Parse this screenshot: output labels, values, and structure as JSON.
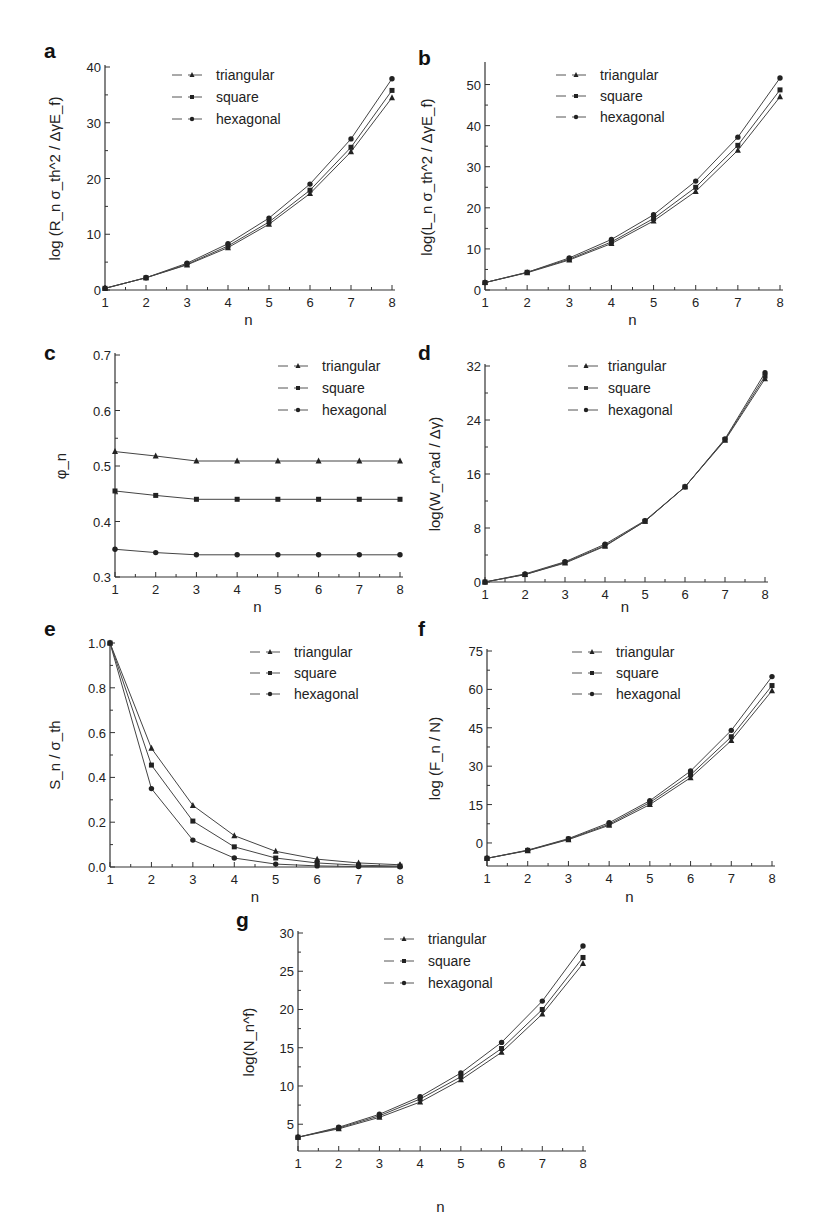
{
  "figure": {
    "legend_labels": [
      "triangular",
      "square",
      "hexagonal"
    ],
    "marker_shapes": [
      "triangle",
      "square",
      "circle"
    ],
    "line_color": "#444444",
    "marker_color": "#222222"
  },
  "chart_data": [
    {
      "panel": "a",
      "type": "line",
      "xlabel": "n",
      "ylabel": "log (R_n σ_th^2 / ΔγE_f)",
      "x": [
        1,
        2,
        3,
        4,
        5,
        6,
        7,
        8
      ],
      "xlim": [
        1,
        8
      ],
      "ylim": [
        0,
        40
      ],
      "yticks": [
        0,
        10,
        20,
        30,
        40
      ],
      "xticks": [
        1,
        2,
        3,
        4,
        5,
        6,
        7,
        8
      ],
      "series": [
        {
          "name": "triangular",
          "values": [
            0.3,
            2.2,
            4.5,
            7.6,
            11.8,
            17.3,
            24.8,
            34.5
          ]
        },
        {
          "name": "square",
          "values": [
            0.3,
            2.2,
            4.6,
            7.9,
            12.2,
            17.9,
            25.6,
            35.8
          ]
        },
        {
          "name": "hexagonal",
          "values": [
            0.3,
            2.2,
            4.8,
            8.3,
            12.9,
            19.0,
            27.1,
            37.9
          ]
        }
      ],
      "legend_position": "upper-center"
    },
    {
      "panel": "b",
      "type": "line",
      "xlabel": "n",
      "ylabel": "log(L_n σ_th^2 / ΔγE_f)",
      "x": [
        1,
        2,
        3,
        4,
        5,
        6,
        7,
        8
      ],
      "xlim": [
        1,
        8
      ],
      "ylim": [
        0,
        55
      ],
      "yticks": [
        0,
        10,
        20,
        30,
        40,
        50
      ],
      "xticks": [
        1,
        2,
        3,
        4,
        5,
        6,
        7,
        8
      ],
      "series": [
        {
          "name": "triangular",
          "values": [
            1.8,
            4.2,
            7.3,
            11.3,
            16.8,
            24.0,
            34.0,
            47.0
          ]
        },
        {
          "name": "square",
          "values": [
            1.8,
            4.3,
            7.5,
            11.7,
            17.4,
            25.0,
            35.2,
            48.7
          ]
        },
        {
          "name": "hexagonal",
          "values": [
            1.8,
            4.3,
            7.8,
            12.3,
            18.3,
            26.5,
            37.2,
            51.6
          ]
        }
      ],
      "legend_position": "upper-center"
    },
    {
      "panel": "c",
      "type": "line",
      "xlabel": "n",
      "ylabel": "φ_n",
      "x": [
        1,
        2,
        3,
        4,
        5,
        6,
        7,
        8
      ],
      "xlim": [
        1,
        8
      ],
      "ylim": [
        0.3,
        0.7
      ],
      "yticks": [
        0.3,
        0.4,
        0.5,
        0.6,
        0.7
      ],
      "xticks": [
        1,
        2,
        3,
        4,
        5,
        6,
        7,
        8
      ],
      "series": [
        {
          "name": "triangular",
          "values": [
            0.526,
            0.518,
            0.509,
            0.509,
            0.509,
            0.509,
            0.509,
            0.509
          ]
        },
        {
          "name": "square",
          "values": [
            0.455,
            0.447,
            0.44,
            0.44,
            0.44,
            0.44,
            0.44,
            0.44
          ]
        },
        {
          "name": "hexagonal",
          "values": [
            0.35,
            0.344,
            0.34,
            0.34,
            0.34,
            0.34,
            0.34,
            0.34
          ]
        }
      ],
      "legend_position": "upper-right"
    },
    {
      "panel": "d",
      "type": "line",
      "xlabel": "n",
      "ylabel": "log(W_n^ad / Δγ)",
      "x": [
        1,
        2,
        3,
        4,
        5,
        6,
        7,
        8
      ],
      "xlim": [
        1,
        8
      ],
      "ylim": [
        0,
        32
      ],
      "yticks": [
        0,
        8,
        16,
        24,
        32
      ],
      "xticks": [
        1,
        2,
        3,
        4,
        5,
        6,
        7,
        8
      ],
      "series": [
        {
          "name": "triangular",
          "values": [
            0.0,
            1.1,
            2.8,
            5.3,
            9.0,
            14.1,
            21.0,
            30.1
          ]
        },
        {
          "name": "square",
          "values": [
            0.0,
            1.1,
            2.9,
            5.4,
            9.0,
            14.1,
            21.1,
            30.5
          ]
        },
        {
          "name": "hexagonal",
          "values": [
            0.0,
            1.2,
            3.0,
            5.6,
            9.1,
            14.1,
            21.2,
            31.0
          ]
        }
      ],
      "legend_position": "upper-center"
    },
    {
      "panel": "e",
      "type": "line",
      "xlabel": "n",
      "ylabel": "S_n / σ_th",
      "x": [
        1,
        2,
        3,
        4,
        5,
        6,
        7,
        8
      ],
      "xlim": [
        1,
        8
      ],
      "ylim": [
        0.0,
        1.0
      ],
      "yticks": [
        0.0,
        0.2,
        0.4,
        0.6,
        0.8,
        1.0
      ],
      "xticks": [
        1,
        2,
        3,
        4,
        5,
        6,
        7,
        8
      ],
      "series": [
        {
          "name": "triangular",
          "values": [
            1.0,
            0.53,
            0.275,
            0.14,
            0.07,
            0.035,
            0.018,
            0.01
          ]
        },
        {
          "name": "square",
          "values": [
            1.0,
            0.455,
            0.205,
            0.09,
            0.04,
            0.018,
            0.008,
            0.004
          ]
        },
        {
          "name": "hexagonal",
          "values": [
            1.0,
            0.35,
            0.12,
            0.04,
            0.013,
            0.005,
            0.002,
            0.001
          ]
        }
      ],
      "legend_position": "upper-right"
    },
    {
      "panel": "f",
      "type": "line",
      "xlabel": "n",
      "ylabel": "log (F_n / N)",
      "x": [
        1,
        2,
        3,
        4,
        5,
        6,
        7,
        8
      ],
      "xlim": [
        1,
        8
      ],
      "ylim": [
        -9,
        75
      ],
      "yticks": [
        0,
        15,
        30,
        45,
        60,
        75
      ],
      "xticks": [
        1,
        2,
        3,
        4,
        5,
        6,
        7,
        8
      ],
      "series": [
        {
          "name": "triangular",
          "values": [
            -6.0,
            -3.0,
            1.3,
            6.9,
            15.0,
            25.5,
            40.0,
            59.5
          ]
        },
        {
          "name": "square",
          "values": [
            -6.0,
            -2.9,
            1.5,
            7.3,
            15.8,
            26.6,
            41.5,
            61.5
          ]
        },
        {
          "name": "hexagonal",
          "values": [
            -6.0,
            -2.8,
            1.7,
            7.9,
            16.5,
            28.1,
            44.0,
            65.0
          ]
        }
      ],
      "legend_position": "upper-center"
    },
    {
      "panel": "g",
      "type": "line",
      "xlabel": "n",
      "ylabel": "log(N_n^f)",
      "x": [
        1,
        2,
        3,
        4,
        5,
        6,
        7,
        8
      ],
      "xlim": [
        1,
        8
      ],
      "ylim": [
        1.5,
        30
      ],
      "yticks": [
        5,
        10,
        15,
        20,
        25,
        30
      ],
      "xticks": [
        1,
        2,
        3,
        4,
        5,
        6,
        7,
        8
      ],
      "series": [
        {
          "name": "triangular",
          "values": [
            3.3,
            4.4,
            5.9,
            7.9,
            10.8,
            14.4,
            19.4,
            26.0
          ]
        },
        {
          "name": "square",
          "values": [
            3.3,
            4.5,
            6.1,
            8.3,
            11.2,
            14.9,
            20.0,
            26.8
          ]
        },
        {
          "name": "hexagonal",
          "values": [
            3.3,
            4.6,
            6.3,
            8.6,
            11.7,
            15.7,
            21.1,
            28.3
          ]
        }
      ],
      "legend_position": "upper-center"
    }
  ],
  "panels": {
    "a": {
      "letter": "a",
      "xlabel": "n"
    },
    "b": {
      "letter": "b",
      "xlabel": "n"
    },
    "c": {
      "letter": "c",
      "xlabel": "n"
    },
    "d": {
      "letter": "d",
      "xlabel": "n"
    },
    "e": {
      "letter": "e",
      "xlabel": "n"
    },
    "f": {
      "letter": "f",
      "xlabel": "n"
    },
    "g": {
      "letter": "g",
      "xlabel": "n"
    }
  }
}
